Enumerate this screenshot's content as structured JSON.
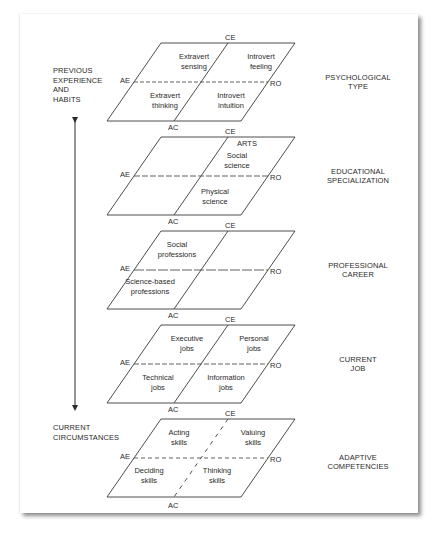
{
  "left_labels": {
    "top": "PREVIOUS\nEXPERIENCE\nAND\nHABITS",
    "bottom": "CURRENT\nCIRCUMSTANCES"
  },
  "axis_labels": {
    "top": "CE",
    "bottom": "AC",
    "left": "AE",
    "right": "RO"
  },
  "colors": {
    "line": "#3a3a3a",
    "text": "#2a2a2a",
    "background": "#ffffff"
  },
  "levels": [
    {
      "title": "PSYCHOLOGICAL\nTYPE",
      "cells": {
        "top_left": "Extravert\nsensing",
        "top_right": "Introvert\nfeeling",
        "bottom_left": "Extravert\nthinking",
        "bottom_right": "Introvert\nintuition"
      }
    },
    {
      "title": "EDUCATIONAL\nSPECIALIZATION",
      "cells": {
        "top_right_header": "ARTS",
        "top_right": "Social\nscience",
        "bottom_right": "Physical\nscience"
      }
    },
    {
      "title": "PROFESSIONAL\nCAREER",
      "cells": {
        "top_left": "Social\nprofessions",
        "bottom_left": "Science-based\nprofessions"
      }
    },
    {
      "title": "CURRENT\nJOB",
      "cells": {
        "top_left": "Executive\njobs",
        "top_right": "Personal\njobs",
        "bottom_left": "Technical\njobs",
        "bottom_right": "Information\njobs"
      }
    },
    {
      "title": "ADAPTIVE\nCOMPETENCIES",
      "cells": {
        "top_left": "Acting\nskills",
        "top_right": "Valuing\nskills",
        "bottom_left": "Deciding\nskills",
        "bottom_right": "Thinking\nskills"
      }
    }
  ]
}
